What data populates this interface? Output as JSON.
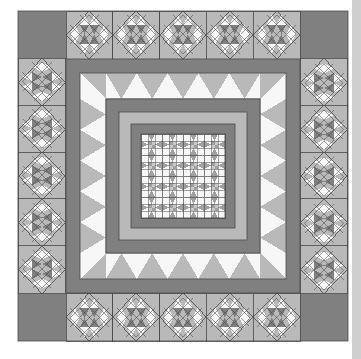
{
  "artwork": {
    "title": "Medallion Sawtooth Quilt Pattern",
    "kind": "quilt-diagram",
    "canvas": {
      "width": 361,
      "height": 359,
      "background": "#ffffff"
    }
  },
  "palette": {
    "background": "#ffffff",
    "dark": "#808080",
    "medium": "#a0a0a0",
    "light": "#b9b9b9",
    "pale": "#c9c9c9",
    "white_patch": "#f7f7f7",
    "outline": "#4a4a4a",
    "edge_strip": "#cfcfcf"
  },
  "layout": {
    "quilt_left": 18,
    "quilt_top": 11,
    "quilt_size": 330,
    "outer_border_width": 48,
    "corner_square": "plain-dark",
    "border_blocks_per_side": 5,
    "rings": [
      {
        "name": "outer-pieced-border",
        "inset": 0,
        "thickness": 48,
        "fill": "#b9b9b9"
      },
      {
        "name": "dark-sashing-1",
        "inset": 48,
        "thickness": 14,
        "fill": "#808080"
      },
      {
        "name": "sawtooth-ring",
        "inset": 62,
        "thickness": 26,
        "fill": "#f7f7f7"
      },
      {
        "name": "dark-sashing-2",
        "inset": 88,
        "thickness": 13,
        "fill": "#808080"
      },
      {
        "name": "light-ring",
        "inset": 101,
        "thickness": 12,
        "fill": "#b9b9b9"
      },
      {
        "name": "dark-sashing-3",
        "inset": 113,
        "thickness": 10,
        "fill": "#808080"
      },
      {
        "name": "center-field",
        "inset": 123,
        "thickness": 84,
        "fill": "#b9b9b9"
      }
    ],
    "center_grid": {
      "rows": 4,
      "cols": 4,
      "block": "shoofly-nine-patch"
    },
    "right_edge_strip": {
      "x": 352,
      "width": 9,
      "fill": "#cfcfcf"
    }
  },
  "motifs": {
    "border_block": {
      "name": "on-point-sawtooth-diamond",
      "description": "Square block with a quarter-turn diamond of small half-square triangles; white and dark triangles alternate within a light field."
    },
    "side_block": {
      "name": "on-point-sawtooth-diamond-rotated",
      "description": "Same diamond motif rotated a quarter turn for the left and right borders."
    },
    "center_block": {
      "name": "shoofly-nine-patch",
      "description": "Nine-patch with white corner squares, half-square triangle sides and a four-patch checkerboard center."
    },
    "sawtooth_ring": {
      "name": "flying-geese-sawtooth",
      "description": "Row of large triangles pointing inward on a white ground."
    }
  },
  "counts": {
    "border_blocks_total": 20,
    "corner_plain_squares": 4,
    "center_blocks": 16,
    "sawtooth_teeth_per_side": 5
  }
}
